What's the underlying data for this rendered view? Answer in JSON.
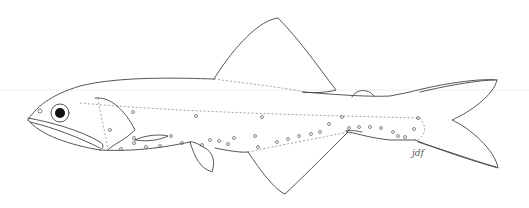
{
  "illustration": {
    "subject": "fish line drawing (lateral view)",
    "signature": "jdf",
    "colors": {
      "line": "#444444",
      "background": "#ffffff",
      "eye": "#111111"
    }
  }
}
